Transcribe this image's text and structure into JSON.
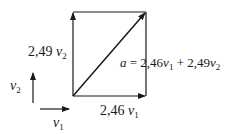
{
  "diagram": {
    "title": "",
    "colors": {
      "stroke": "#1a1a1a",
      "background": "#ffffff"
    },
    "labels": {
      "left_side": {
        "coef": "2,49",
        "var": "v",
        "sub": "2"
      },
      "diagonal": {
        "lhs": "a",
        "eq": " = 2,46",
        "v1": "v",
        "s1": "1",
        "plus": " + 2,49",
        "v2": "v",
        "s2": "2"
      },
      "bottom_side": {
        "coef": "2,46",
        "var": "v",
        "sub": "1"
      },
      "basis_v2": {
        "var": "v",
        "sub": "2"
      },
      "basis_v1": {
        "var": "v",
        "sub": "1"
      }
    },
    "vectors": [
      {
        "name": "v1",
        "from": [
          40,
          109
        ],
        "to": [
          70,
          109
        ]
      },
      {
        "name": "v2",
        "from": [
          33,
          103
        ],
        "to": [
          33,
          72
        ]
      },
      {
        "name": "2.46 v1",
        "from": [
          73,
          96
        ],
        "to": [
          146,
          96
        ]
      },
      {
        "name": "2.49 v2",
        "from": [
          73,
          96
        ],
        "to": [
          73,
          12
        ]
      },
      {
        "name": "a",
        "from": [
          73,
          96
        ],
        "to": [
          146,
          12
        ]
      }
    ]
  }
}
